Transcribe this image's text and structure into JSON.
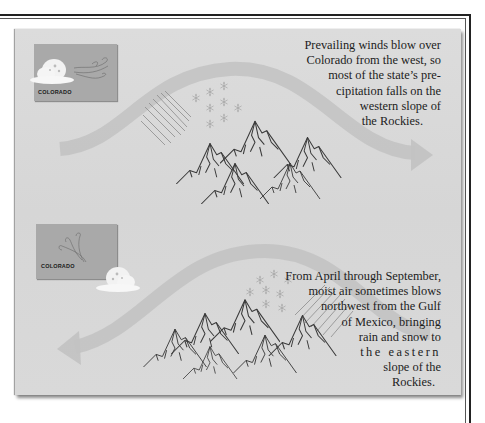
{
  "panels": [
    {
      "id": "west-winds",
      "map_label": "COLORADO",
      "caption_lines": [
        "Prevailing winds blow over",
        "Colorado from the west, so",
        "most of the state’s pre-",
        "cipitation falls on the",
        "western slope of",
        "the Rockies."
      ],
      "wind_direction": "west-to-east",
      "icons": [
        "cloud-icon",
        "wind-icon",
        "snowflake-icon",
        "rain-icon",
        "mountains-icon",
        "arrow-right-icon"
      ]
    },
    {
      "id": "gulf-moisture",
      "map_label": "COLORADO",
      "caption_lines": [
        "From April through September,",
        "moist air sometimes blows",
        "northwest from the Gulf",
        "of Mexico, bringing",
        "rain and snow to",
        "the eastern",
        "slope of the",
        "Rockies."
      ],
      "wind_direction": "east-to-west",
      "icons": [
        "cloud-icon",
        "wind-icon",
        "snowflake-icon",
        "rain-icon",
        "mountains-icon",
        "arrow-left-icon"
      ]
    }
  ],
  "colors": {
    "background": "#d8d8d8",
    "map_box": "#a9a9a9",
    "arrow": "#bdbdbd",
    "ink": "#1c1c1c",
    "frame": "#222222"
  }
}
